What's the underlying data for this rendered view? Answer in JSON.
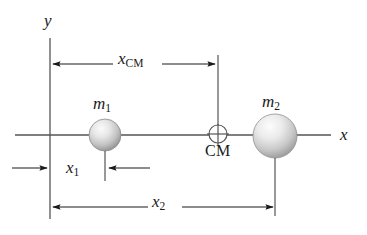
{
  "figure": {
    "background_color": "#ffffff",
    "line_color": "#4a4a4a",
    "arrow_color": "#1a1a1a",
    "text_color": "#1a1a1a"
  },
  "axes": {
    "y_axis_label": "y",
    "x_axis_label": "x",
    "y_axis": {
      "x": 50,
      "y_top": 38,
      "y_bottom": 219
    },
    "x_axis": {
      "y": 135,
      "x_left": 15,
      "x_right": 331
    }
  },
  "bodies": [
    {
      "name": "mass-1",
      "label_main": "m",
      "label_sub": "1",
      "cx": 105,
      "cy": 135,
      "r": 16,
      "fill_light": "#f2f2f2",
      "fill_dark": "#8f8f8f"
    },
    {
      "name": "mass-2",
      "label_main": "m",
      "label_sub": "2",
      "cx": 275,
      "cy": 136,
      "r": 22,
      "fill_light": "#f4f4f4",
      "fill_dark": "#9a9a9a"
    }
  ],
  "center_of_mass": {
    "symbol_label": "CM",
    "cx": 218,
    "cy": 134,
    "r": 9
  },
  "dimensions": [
    {
      "name": "x-cm",
      "label_main": "x",
      "label_sub": "CM",
      "from_x": 51,
      "to_x": 217,
      "y": 64,
      "style": "double-arrow-inward"
    },
    {
      "name": "x-1",
      "label_main": "x",
      "label_sub": "1",
      "from_x": 50,
      "to_x": 105,
      "y": 168,
      "style": "double-arrow-outward"
    },
    {
      "name": "x-2",
      "label_main": "x",
      "label_sub": "2",
      "from_x": 51,
      "to_x": 275,
      "y": 207,
      "style": "double-arrow-inward"
    }
  ]
}
